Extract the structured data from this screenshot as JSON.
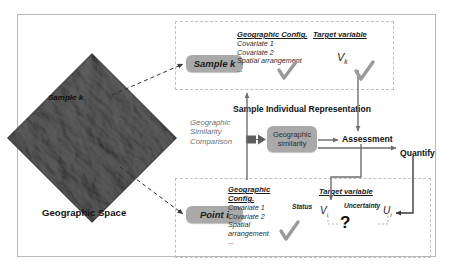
{
  "diagram": {
    "outer_frame": true
  },
  "geographic_space": {
    "panel_label": "Geographic Space",
    "sample_label": "Sample k",
    "image_name": "terrain-dem-diamond"
  },
  "sample_panel": {
    "pill_label": "Sample k",
    "config_header": "Geographic Config.",
    "config_items": [
      "Covariate 1",
      "Covariate 2",
      "Spatial arrangement",
      "..."
    ],
    "config_check": "check-icon",
    "target_header": "Target variable",
    "target_symbol": "V",
    "target_subscript": "k",
    "target_check": "check-icon"
  },
  "point_panel": {
    "pill_label": "Point i",
    "config_header": "Geographic Config.",
    "config_items": [
      "Covariate 1",
      "Covariate 2",
      "Spatial arrangement",
      "..."
    ],
    "config_check": "check-icon",
    "target_header": "Target variable",
    "status_label": "Status",
    "status_symbol": "V",
    "status_subscript": "i",
    "uncertainty_label": "Uncertainty",
    "uncertainty_symbol": "U",
    "uncertainty_subscript": "i",
    "unknown_marker": "?"
  },
  "middle": {
    "comparison_label_line1": "Geographic",
    "comparison_label_line2": "Similarity",
    "comparison_label_line3": "Comparison",
    "representation_title": "Sample Individual Representation",
    "similarity_box_line1": "Geographic",
    "similarity_box_line2": "similarity",
    "assessment_label": "Assessment",
    "quantify_label": "Quantify"
  },
  "colors": {
    "pill_gray": "#a9a9a9",
    "dashed_border": "#c0c0c0",
    "frame_border": "#b8b8b8",
    "check_gray": "#9a9a9a",
    "connector_gray": "#777777",
    "text_dark": "#1a1a1a",
    "muted_italic": "#6f6f6f",
    "background": "#ffffff"
  }
}
